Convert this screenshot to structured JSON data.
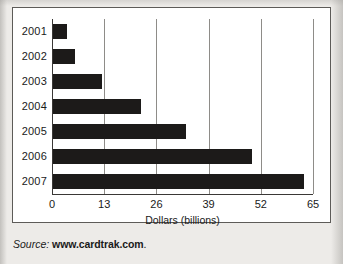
{
  "chart_data": {
    "type": "bar",
    "orientation": "horizontal",
    "title": "",
    "subtitle": "",
    "xlabel": "Dollars (billions)",
    "ylabel": "",
    "categories": [
      "2001",
      "2002",
      "2003",
      "2004",
      "2005",
      "2006",
      "2007"
    ],
    "values": [
      3.5,
      5.5,
      12.3,
      21.8,
      33,
      49.5,
      62.5
    ],
    "xlim": [
      0,
      65
    ],
    "xticks": [
      0,
      13,
      26,
      39,
      52,
      65
    ],
    "xtick_labels": [
      "0",
      "13",
      "26",
      "39",
      "52",
      "65"
    ],
    "grid": "vertical",
    "legend": "none",
    "bar_color": "#1c1a19",
    "plot_background": "#ffffff",
    "gridline_color": "#8e8c88",
    "axis_color": "#3a3836"
  },
  "source": {
    "label": "Source:",
    "url": "www.cardtrak.com",
    "period": "."
  },
  "figure": {
    "background": "#edebe8",
    "card_background": "#ffffff",
    "card_border": "#5d5b58"
  }
}
